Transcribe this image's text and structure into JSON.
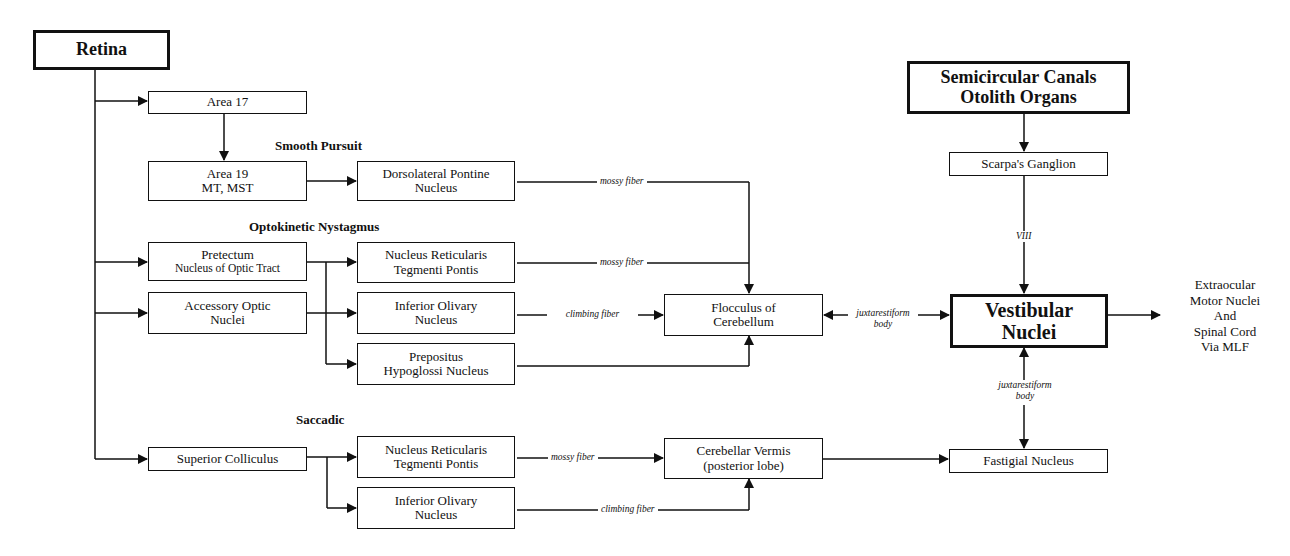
{
  "diagram": {
    "nodes": {
      "retina": {
        "line1": "Retina"
      },
      "area17": {
        "line1": "Area 17"
      },
      "area19": {
        "line1": "Area 19",
        "line2": "MT, MST"
      },
      "dlpn": {
        "line1": "Dorsolateral Pontine",
        "line2": "Nucleus"
      },
      "pretectum": {
        "line1": "Pretectum",
        "line2": "Nucleus of Optic Tract"
      },
      "aon": {
        "line1": "Accessory Optic",
        "line2": "Nuclei"
      },
      "nrtp_okn": {
        "line1": "Nucleus Reticularis",
        "line2": "Tegmenti Pontis"
      },
      "io_okn": {
        "line1": "Inferior Olivary",
        "line2": "Nucleus"
      },
      "prepositus": {
        "line1": "Prepositus",
        "line2": "Hypoglossi Nucleus"
      },
      "sc": {
        "line1": "Superior Colliculus"
      },
      "nrtp_sacc": {
        "line1": "Nucleus Reticularis",
        "line2": "Tegmenti Pontis"
      },
      "io_sacc": {
        "line1": "Inferior Olivary",
        "line2": "Nucleus"
      },
      "flocculus": {
        "line1": "Flocculus of",
        "line2": "Cerebellum"
      },
      "vermis": {
        "line1": "Cerebellar Vermis",
        "line2": "(posterior lobe)"
      },
      "canals": {
        "line1": "Semicircular Canals",
        "line2": "Otolith Organs"
      },
      "scarpa": {
        "line1": "Scarpa's Ganglion"
      },
      "vestibular": {
        "line1": "Vestibular",
        "line2": "Nuclei"
      },
      "fastigial": {
        "line1": "Fastigial Nucleus"
      }
    },
    "sections": {
      "smooth_pursuit": "Smooth Pursuit",
      "okn": "Optokinetic Nystagmus",
      "saccadic": "Saccadic"
    },
    "edge_labels": {
      "mossy1": "mossy fiber",
      "mossy2": "mossy fiber",
      "climbing1": "climbing fiber",
      "mossy3": "mossy fiber",
      "climbing2": "climbing fiber",
      "juxta1_l1": "juxtarestiform",
      "juxta1_l2": "body",
      "juxta2_l1": "juxtarestiform",
      "juxta2_l2": "body",
      "viii": "VIII"
    },
    "output": {
      "line1": "Extraocular",
      "line2": "Motor Nuclei",
      "line3": "And",
      "line4": "Spinal Cord",
      "line5": "Via MLF"
    }
  }
}
